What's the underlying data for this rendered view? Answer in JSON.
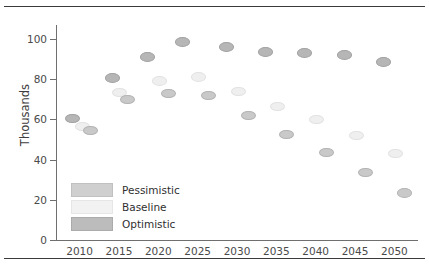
{
  "figure": {
    "has_top_rule": true,
    "has_bottom_rule": true
  },
  "chart_data": {
    "type": "scatter",
    "title": "",
    "subtitle": "",
    "xlabel": "",
    "ylabel": "Thousands",
    "xlim": [
      2007,
      2053
    ],
    "ylim": [
      0,
      105
    ],
    "xticks": [
      2010,
      2015,
      2020,
      2025,
      2030,
      2035,
      2040,
      2045,
      2050
    ],
    "xtick_labels": [
      "2010",
      "2015",
      "2020",
      "2025",
      "2030",
      "2035",
      "2040",
      "2045",
      "2050"
    ],
    "yticks": [
      0,
      20,
      40,
      60,
      80,
      100
    ],
    "ytick_labels": [
      "0",
      "20",
      "40",
      "60",
      "80",
      "100"
    ],
    "grid": false,
    "legend_position": "inside-lower-left",
    "marker_shape": "ellipse",
    "colors": {
      "pessimistic": "#c9c9c9",
      "baseline": "#efefef",
      "optimistic": "#b6b6b6",
      "axis": "#6f6f6f",
      "text": "#3d3d3d",
      "background": "#ffffff"
    },
    "series": [
      {
        "name": "Optimistic",
        "key": "optimistic",
        "color": "#b6b6b6",
        "points": [
          {
            "x": 2009,
            "y": 61
          },
          {
            "x": 2014,
            "y": 81
          },
          {
            "x": 2018.5,
            "y": 91.5
          },
          {
            "x": 2023,
            "y": 99
          },
          {
            "x": 2028.5,
            "y": 96.5
          },
          {
            "x": 2033.5,
            "y": 94
          },
          {
            "x": 2038.5,
            "y": 93.5
          },
          {
            "x": 2043.5,
            "y": 92.5
          },
          {
            "x": 2048.5,
            "y": 89
          }
        ]
      },
      {
        "name": "Baseline",
        "key": "baseline",
        "color": "#efefef",
        "points": [
          {
            "x": 2010.2,
            "y": 57
          },
          {
            "x": 2015,
            "y": 74
          },
          {
            "x": 2020,
            "y": 79.5
          },
          {
            "x": 2025,
            "y": 81.5
          },
          {
            "x": 2030,
            "y": 74.5
          },
          {
            "x": 2035,
            "y": 67
          },
          {
            "x": 2040,
            "y": 60.5
          },
          {
            "x": 2045,
            "y": 52.5
          },
          {
            "x": 2050,
            "y": 43.5
          }
        ]
      },
      {
        "name": "Pessimistic",
        "key": "pessimistic",
        "color": "#c9c9c9",
        "points": [
          {
            "x": 2011.3,
            "y": 55
          },
          {
            "x": 2016,
            "y": 70.5
          },
          {
            "x": 2021.2,
            "y": 73.5
          },
          {
            "x": 2026.3,
            "y": 72.5
          },
          {
            "x": 2031.3,
            "y": 62.5
          },
          {
            "x": 2036.2,
            "y": 53
          },
          {
            "x": 2041.2,
            "y": 44
          },
          {
            "x": 2046.2,
            "y": 34
          },
          {
            "x": 2051.2,
            "y": 24
          }
        ]
      }
    ],
    "legend_entries": [
      {
        "label": "Pessimistic",
        "key": "pessimistic"
      },
      {
        "label": "Baseline",
        "key": "baseline"
      },
      {
        "label": "Optimistic",
        "key": "optimistic"
      }
    ]
  }
}
